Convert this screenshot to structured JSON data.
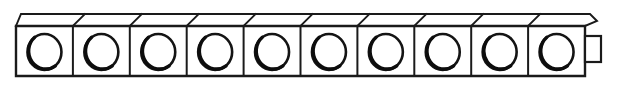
{
  "figure": {
    "background_color": "#ffffff",
    "line_color": "#1a1a1a",
    "circle_color": "#141414",
    "canvas": {
      "width": 618,
      "height": 92
    }
  },
  "geometry": {
    "row": {
      "unit_count": 10,
      "front_left_x": 16,
      "front_right_x": 585,
      "front_top_y": 26,
      "front_bottom_y": 76,
      "unit_width": 56.9,
      "top_face_depth": 12,
      "top_face_shear_x": 12,
      "corner_chamfer": 7
    },
    "circle": {
      "radius_x": 17,
      "radius_y": 18,
      "center_y": 52,
      "stroke_width": 2.6,
      "shade_stroke_width": 3.4
    },
    "tab": {
      "x": 585,
      "y": 36,
      "width": 16,
      "height": 26,
      "stroke_width": 2.2
    },
    "stroke_widths": {
      "outline": 2.4,
      "divider": 2.0,
      "top_face": 1.9
    }
  },
  "units": [
    {
      "index": 1,
      "label": "block-1",
      "hole": "circle"
    },
    {
      "index": 2,
      "label": "block-2",
      "hole": "circle"
    },
    {
      "index": 3,
      "label": "block-3",
      "hole": "circle"
    },
    {
      "index": 4,
      "label": "block-4",
      "hole": "circle"
    },
    {
      "index": 5,
      "label": "block-5",
      "hole": "circle"
    },
    {
      "index": 6,
      "label": "block-6",
      "hole": "circle"
    },
    {
      "index": 7,
      "label": "block-7",
      "hole": "circle"
    },
    {
      "index": 8,
      "label": "block-8",
      "hole": "circle"
    },
    {
      "index": 9,
      "label": "block-9",
      "hole": "circle"
    },
    {
      "index": 10,
      "label": "block-10",
      "hole": "circle"
    }
  ]
}
